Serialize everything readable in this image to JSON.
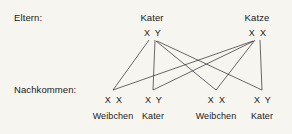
{
  "diagram": {
    "background_color": "#f7f5ef",
    "line_color": "#2b2b2b",
    "text_color": "#1a1a1a",
    "rows": {
      "parents_label": "Eltern:",
      "offspring_label": "Nachkommen:"
    },
    "parents": [
      {
        "name": "Kater",
        "genotype": "X Y",
        "x": 152,
        "y": 40
      },
      {
        "name": "Katze",
        "genotype": "X X",
        "x": 257,
        "y": 40
      }
    ],
    "offspring": [
      {
        "genotype": "X X",
        "name": "Weibchen",
        "x": 113,
        "y": 90
      },
      {
        "genotype": "X Y",
        "name": "Kater",
        "x": 153,
        "y": 90
      },
      {
        "genotype": "X X",
        "name": "Weibchen",
        "x": 216,
        "y": 90
      },
      {
        "genotype": "X Y",
        "name": "Kater",
        "x": 262,
        "y": 90
      }
    ],
    "edges": [
      {
        "from": "Kater",
        "to": "Weibchen-1",
        "x1": 149,
        "y1": 40,
        "x2": 113,
        "y2": 90
      },
      {
        "from": "Kater",
        "to": "Kater-2",
        "x1": 155,
        "y1": 40,
        "x2": 153,
        "y2": 90
      },
      {
        "from": "Kater",
        "to": "Weibchen-3",
        "x1": 156,
        "y1": 41,
        "x2": 216,
        "y2": 90
      },
      {
        "from": "Kater",
        "to": "Kater-4",
        "x1": 157,
        "y1": 41,
        "x2": 262,
        "y2": 90
      },
      {
        "from": "Katze",
        "to": "Weibchen-1",
        "x1": 253,
        "y1": 41,
        "x2": 113,
        "y2": 90
      },
      {
        "from": "Katze",
        "to": "Kater-2",
        "x1": 254,
        "y1": 41,
        "x2": 153,
        "y2": 90
      },
      {
        "from": "Katze",
        "to": "Weibchen-3",
        "x1": 255,
        "y1": 40,
        "x2": 216,
        "y2": 90
      },
      {
        "from": "Katze",
        "to": "Kater-4",
        "x1": 260,
        "y1": 40,
        "x2": 262,
        "y2": 90
      }
    ]
  }
}
